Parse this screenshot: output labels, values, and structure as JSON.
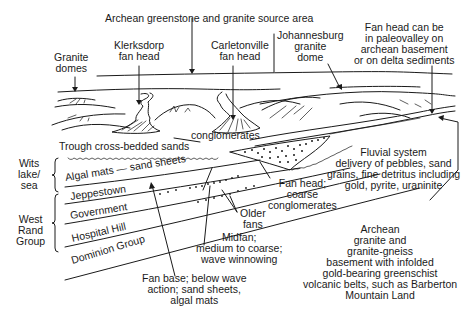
{
  "diagram": {
    "top_labels": {
      "source_area": "Archean greenstone and granite source area",
      "granite_domes": [
        "Granite",
        "domes"
      ],
      "klerksdorp": [
        "Klerksdorp",
        "fan head"
      ],
      "carletonville": [
        "Carletonville",
        "fan head"
      ],
      "johannesburg": [
        "Johannesburg",
        "granite",
        "dome"
      ],
      "fan_head_paleovalley": [
        "Fan head can be",
        "in paleovalley on",
        "archean basement",
        "or on delta sediments"
      ]
    },
    "middle_labels": {
      "trough": "Trough cross-bedded sands",
      "conglomerates": "conglomerates",
      "fluvial": [
        "Fluvial system",
        "delivery of pebbles, sand",
        "grains, fine detritus including",
        "gold, pyrite, uraninite"
      ],
      "fan_head_coarse": [
        "Fan head;",
        "coarse",
        "conglomerates"
      ],
      "older_fans": [
        "Older",
        "fans"
      ],
      "midfan": [
        "Midfan;",
        "medium to coarse;",
        "wave winnowing"
      ],
      "fan_base": [
        "Fan base; below wave",
        "action; sand sheets,",
        "algal mats"
      ],
      "basement": [
        "Archean",
        "granite and",
        "granite-gneiss",
        "basement with infolded",
        "gold-bearing greenschist",
        "volcanic belts, such as Barberton",
        "Mountain  Land"
      ]
    },
    "groups": {
      "wits": [
        "Wits",
        "lake/",
        "sea"
      ],
      "west_rand": [
        "West",
        "Rand",
        "Group"
      ]
    },
    "strata": [
      "Algal mats — sand  sheets",
      "Jeppestown",
      "Government",
      "Hospital Hill",
      "Dominion Group"
    ]
  }
}
